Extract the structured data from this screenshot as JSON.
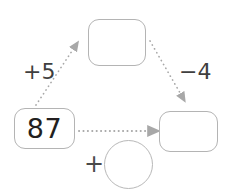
{
  "diagram": {
    "type": "arithmetic-chain-diagram",
    "background_color": "#ffffff",
    "box_border_color": "#b4b4b4",
    "arrow_color": "#a8a8a8",
    "text_color": "#231f20",
    "nodes": [
      {
        "id": "start",
        "name": "start-value-box",
        "value": "87",
        "filled": true
      },
      {
        "id": "top",
        "name": "intermediate-value-box",
        "value": "",
        "filled": false
      },
      {
        "id": "result",
        "name": "result-value-box",
        "value": "",
        "filled": false
      },
      {
        "id": "circle",
        "name": "operand-circle",
        "value": "",
        "filled": false
      }
    ],
    "operators": {
      "add_five": "+5",
      "subtract_four": "−4",
      "plus_sign": "+"
    },
    "arrows": [
      {
        "name": "arrow-start-to-top",
        "from": "start",
        "to": "top",
        "style": "dotted"
      },
      {
        "name": "arrow-top-to-result",
        "from": "top",
        "to": "result",
        "style": "dotted"
      },
      {
        "name": "arrow-start-to-result",
        "from": "start",
        "to": "result",
        "style": "dotted"
      }
    ]
  }
}
